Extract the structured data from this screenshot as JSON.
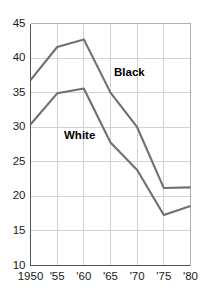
{
  "chart_data": {
    "type": "line",
    "title": "",
    "subtitle": "",
    "xlabel": "",
    "ylabel": "",
    "x": [
      "1950",
      "'55",
      "'60",
      "'65",
      "'70",
      "'75",
      "'80"
    ],
    "categories": [
      "1950",
      "'55",
      "'60",
      "'65",
      "'70",
      "'75",
      "'80"
    ],
    "xtick_labels": [
      "1950",
      "'55",
      "'60",
      "'65",
      "'70",
      "'75",
      "'80"
    ],
    "ytick_labels": [
      "45",
      "40",
      "35",
      "30",
      "25",
      "20",
      "15",
      "10"
    ],
    "yticks": [
      45,
      40,
      35,
      30,
      25,
      20,
      15,
      10
    ],
    "ylim": [
      10,
      45
    ],
    "grid": true,
    "legend_position": "inline-annotation",
    "series": [
      {
        "name": "Black",
        "color": "#707070",
        "values": [
          36.8,
          41.6,
          42.7,
          35.0,
          30.0,
          21.2,
          21.3
        ],
        "label": "Black",
        "label_x": "'65",
        "label_y": 36.6
      },
      {
        "name": "White",
        "color": "#707070",
        "values": [
          30.4,
          34.9,
          35.6,
          27.8,
          23.8,
          17.3,
          18.6
        ],
        "label": "White",
        "label_x": "'57",
        "label_y": 28.5
      }
    ],
    "annotations": [
      {
        "text": "Black",
        "series": "Black"
      },
      {
        "text": "White",
        "series": "White"
      }
    ],
    "colors": {
      "line": "#707070",
      "grid": "#c8c8c8",
      "axis": "#555555",
      "text": "#1a1a1a",
      "background": "#ffffff"
    }
  }
}
